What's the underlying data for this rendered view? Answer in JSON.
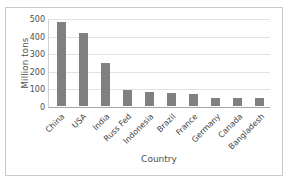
{
  "chart_data": {
    "type": "bar",
    "title": "",
    "xlabel": "Country",
    "ylabel": "Million tons",
    "categories": [
      "China",
      "USA",
      "India",
      "Russ Fed",
      "Indonesia",
      "Brazil",
      "France",
      "Germany",
      "Canada",
      "Bangladesh"
    ],
    "values": [
      483,
      421,
      247,
      93,
      78,
      72,
      70,
      48,
      47,
      47
    ],
    "ylim": [
      0,
      500
    ],
    "yticks": [
      0,
      100,
      200,
      300,
      400,
      500
    ],
    "ytick_labels": [
      "0",
      "100",
      "200",
      "300",
      "400",
      "500"
    ],
    "grid": true,
    "legend": "none",
    "bar_color": "#808080",
    "gridline_color": "#e2e2e2",
    "axis_color": "#a8a8a8",
    "border_color": "#c9c9c9",
    "background": "#ffffff"
  }
}
